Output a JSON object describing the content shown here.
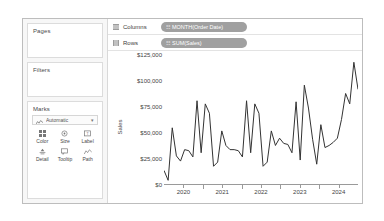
{
  "left_panel": {
    "cards": [
      {
        "title": "Pages"
      },
      {
        "title": "Filters"
      },
      {
        "title": "Marks"
      }
    ],
    "marks": {
      "type_label": "Automatic",
      "type_icon": "line-chart-icon",
      "dropdown_caret": "▾",
      "buttons": [
        {
          "name": "Color",
          "icon": "color-squares-icon"
        },
        {
          "name": "Size",
          "icon": "size-circle-icon"
        },
        {
          "name": "Label",
          "icon": "label-tag-icon"
        },
        {
          "name": "Detail",
          "icon": "detail-icon"
        },
        {
          "name": "Tooltip",
          "icon": "tooltip-bubble-icon"
        },
        {
          "name": "Path",
          "icon": "path-line-icon"
        }
      ]
    }
  },
  "shelves": [
    {
      "label": "Columns",
      "icon": "columns-grid-icon",
      "pill": {
        "text": "MONTH(Order Date)",
        "prefix": "☷",
        "color": "#a0a0a0"
      }
    },
    {
      "label": "Rows",
      "icon": "rows-grid-icon",
      "pill": {
        "text": "SUM(Sales)",
        "prefix": "☷",
        "color": "#a0a0a0"
      }
    }
  ],
  "chart_data": {
    "type": "line",
    "title": "",
    "xlabel": "",
    "ylabel": "Sales",
    "ylim": [
      0,
      125000
    ],
    "ytick_labels": [
      "$0",
      "$25,000",
      "$50,000",
      "$75,000",
      "$100,000",
      "$125,000"
    ],
    "ytick_values": [
      0,
      25000,
      50000,
      75000,
      100000,
      125000
    ],
    "xtick_labels": [
      "2020",
      "2021",
      "2022",
      "2023",
      "2024"
    ],
    "xtick_values": [
      2020,
      2021,
      2022,
      2023,
      2024
    ],
    "grid": false,
    "legend": "none",
    "line_color": "#333333",
    "series": [
      {
        "name": "SUM(Sales)",
        "x": [
          "2020-01",
          "2020-02",
          "2020-03",
          "2020-04",
          "2020-05",
          "2020-06",
          "2020-07",
          "2020-08",
          "2020-09",
          "2020-10",
          "2020-11",
          "2020-12",
          "2021-01",
          "2021-02",
          "2021-03",
          "2021-04",
          "2021-05",
          "2021-06",
          "2021-07",
          "2021-08",
          "2021-09",
          "2021-10",
          "2021-11",
          "2021-12",
          "2022-01",
          "2022-02",
          "2022-03",
          "2022-04",
          "2022-05",
          "2022-06",
          "2022-07",
          "2022-08",
          "2022-09",
          "2022-10",
          "2022-11",
          "2022-12",
          "2023-01",
          "2023-02",
          "2023-03",
          "2023-04",
          "2023-05",
          "2023-06",
          "2023-07",
          "2023-08",
          "2023-09",
          "2023-10",
          "2023-11",
          "2023-12"
        ],
        "values": [
          14000,
          4500,
          55000,
          28000,
          23000,
          34000,
          33000,
          27000,
          81000,
          31000,
          78000,
          69000,
          18000,
          22000,
          52000,
          38000,
          34000,
          34000,
          33000,
          27000,
          81000,
          31000,
          78000,
          69000,
          18000,
          22000,
          52000,
          38000,
          45000,
          40000,
          39000,
          31000,
          80000,
          24000,
          96000,
          74000,
          44000,
          20000,
          58000,
          36000,
          38000,
          41000,
          45000,
          63000,
          88000,
          78000,
          118000,
          92000
        ]
      }
    ]
  }
}
